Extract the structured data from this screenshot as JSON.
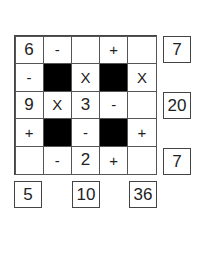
{
  "puzzle": {
    "grid": [
      [
        {
          "v": "6",
          "t": "num"
        },
        {
          "v": "-",
          "t": "op"
        },
        {
          "v": "",
          "t": "num"
        },
        {
          "v": "+",
          "t": "op"
        },
        {
          "v": "",
          "t": "num"
        }
      ],
      [
        {
          "v": "-",
          "t": "op"
        },
        {
          "v": "",
          "t": "black"
        },
        {
          "v": "X",
          "t": "op"
        },
        {
          "v": "",
          "t": "black"
        },
        {
          "v": "X",
          "t": "op"
        }
      ],
      [
        {
          "v": "9",
          "t": "num"
        },
        {
          "v": "X",
          "t": "op"
        },
        {
          "v": "3",
          "t": "num"
        },
        {
          "v": "-",
          "t": "op"
        },
        {
          "v": "",
          "t": "num"
        }
      ],
      [
        {
          "v": "+",
          "t": "op"
        },
        {
          "v": "",
          "t": "black"
        },
        {
          "v": "-",
          "t": "op"
        },
        {
          "v": "",
          "t": "black"
        },
        {
          "v": "+",
          "t": "op"
        }
      ],
      [
        {
          "v": "",
          "t": "num"
        },
        {
          "v": "-",
          "t": "op"
        },
        {
          "v": "2",
          "t": "num"
        },
        {
          "v": "+",
          "t": "op"
        },
        {
          "v": "",
          "t": "num"
        }
      ]
    ],
    "row_results": [
      "7",
      "20",
      "7"
    ],
    "col_results": [
      "5",
      "10",
      "36"
    ]
  }
}
